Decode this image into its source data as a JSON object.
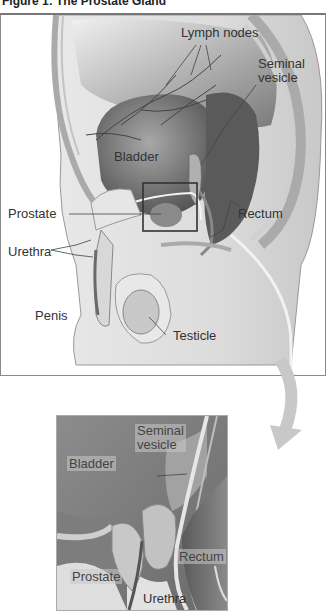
{
  "figure": {
    "title": "Figure 1: The Prostate Gland"
  },
  "main_view": {
    "labels": {
      "lymph_nodes": "Lymph nodes",
      "seminal_vesicle_line1": "Seminal",
      "seminal_vesicle_line2": "vesicle",
      "bladder": "Bladder",
      "prostate": "Prostate",
      "rectum": "Rectum",
      "urethra": "Urethra",
      "penis": "Penis",
      "testicle": "Testicle"
    }
  },
  "inset_view": {
    "labels": {
      "seminal_vesicle_line1": "Seminal",
      "seminal_vesicle_line2": "vesicle",
      "bladder": "Bladder",
      "prostate": "Prostate",
      "urethra": "Urethra",
      "rectum": "Rectum"
    }
  },
  "colors": {
    "panel_border": "#8a8a8a",
    "tissue_dark": "#5e5e5e",
    "tissue_mid": "#9c9c9c",
    "tissue_light": "#e2e2e2",
    "arrow": "#c8c8c8"
  }
}
